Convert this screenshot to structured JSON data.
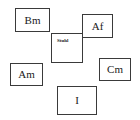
{
  "diagram": {
    "background_color": "#ffffff",
    "border_color": "#3a3a3a",
    "text_color": "#1a1a1a",
    "nodes": [
      {
        "id": "bm",
        "label": "Bm"
      },
      {
        "id": "af",
        "label": "Af"
      },
      {
        "id": "stuhl",
        "label": "Stuhl"
      },
      {
        "id": "am",
        "label": "Am"
      },
      {
        "id": "cm",
        "label": "Cm"
      },
      {
        "id": "i",
        "label": "I"
      }
    ]
  }
}
